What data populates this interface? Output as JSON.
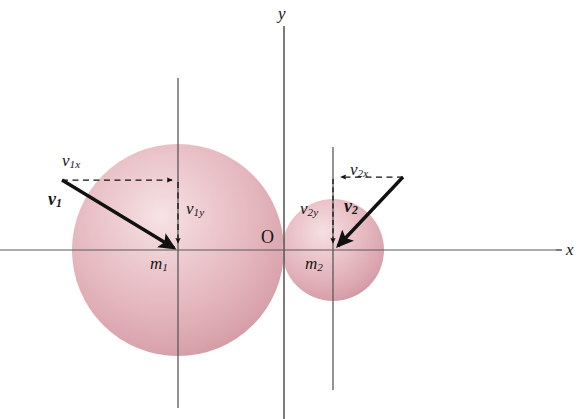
{
  "figure": {
    "background_color": "#ffffff",
    "axes": {
      "x_label": "x",
      "y_label": "y",
      "origin_label": "O",
      "axis_color": "#4a4a4a",
      "x_axis": {
        "y": 250,
        "x_start": 0,
        "x_end": 562
      },
      "y_axis": {
        "x": 284,
        "y_start": 26,
        "y_end": 419
      }
    },
    "guide_lines": [
      {
        "name": "m1-vertical-guide",
        "x": 178,
        "y_start": 78,
        "y_end": 408
      },
      {
        "name": "m2-vertical-guide",
        "x": 333,
        "y_start": 147,
        "y_end": 390
      }
    ],
    "spheres": [
      {
        "name": "sphere-m1",
        "label": "m",
        "subscript": "1",
        "cx": 178,
        "cy": 250,
        "r": 106,
        "fill_edge": "#d49aa4",
        "fill_mid": "#e3b2ba",
        "fill_highlight": "#f3dcdf"
      },
      {
        "name": "sphere-m2",
        "label": "m",
        "subscript": "2",
        "cx": 333,
        "cy": 250,
        "r": 51,
        "fill_edge": "#d49aa4",
        "fill_mid": "#e3b2ba",
        "fill_highlight": "#f3dcdf"
      }
    ],
    "vectors": [
      {
        "name": "velocity-v1",
        "label": "v",
        "subscript": "1",
        "x1": 62,
        "y1": 180,
        "x2": 178,
        "y2": 250,
        "color": "#111111",
        "style": "solid-bold"
      },
      {
        "name": "velocity-v2",
        "label": "v",
        "subscript": "2",
        "x1": 403,
        "y1": 177,
        "x2": 334,
        "y2": 250,
        "color": "#111111",
        "style": "solid-bold"
      }
    ],
    "components": [
      {
        "name": "component-v1x",
        "label": "v",
        "subscript": "1x",
        "x1": 62,
        "y1": 180,
        "x2": 176,
        "y2": 180,
        "style": "dashed",
        "direction": "right"
      },
      {
        "name": "component-v1y",
        "label": "v",
        "subscript": "1y",
        "x1": 178,
        "y1": 181,
        "x2": 178,
        "y2": 248,
        "style": "dashed",
        "direction": "down"
      },
      {
        "name": "component-v2x",
        "label": "v",
        "subscript": "2x",
        "x1": 403,
        "y1": 177,
        "x2": 335,
        "y2": 177,
        "style": "dashed",
        "direction": "left"
      },
      {
        "name": "component-v2y",
        "label": "v",
        "subscript": "2y",
        "x1": 333,
        "y1": 178,
        "x2": 333,
        "y2": 248,
        "style": "dashed",
        "direction": "down"
      }
    ],
    "labels": {
      "v1x": {
        "base": "v",
        "sub": "1x",
        "x": 62,
        "y": 152
      },
      "v1": {
        "base": "v",
        "sub": "1",
        "x": 48,
        "y": 190
      },
      "v1y": {
        "base": "v",
        "sub": "1y",
        "x": 186,
        "y": 200
      },
      "m1": {
        "base": "m",
        "sub": "1",
        "x": 150,
        "y": 255
      },
      "v2x": {
        "base": "v",
        "sub": "2x",
        "x": 350,
        "y": 161
      },
      "v2": {
        "base": "v",
        "sub": "2",
        "x": 344,
        "y": 197
      },
      "v2y": {
        "base": "v",
        "sub": "2y",
        "x": 300,
        "y": 200
      },
      "m2": {
        "base": "m",
        "sub": "2",
        "x": 305,
        "y": 255
      },
      "x_axis": {
        "base": "x",
        "x": 566,
        "y": 241
      },
      "y_axis": {
        "base": "y",
        "x": 278,
        "y": 5
      },
      "origin": {
        "base": "O",
        "x": 261,
        "y": 228
      }
    }
  }
}
